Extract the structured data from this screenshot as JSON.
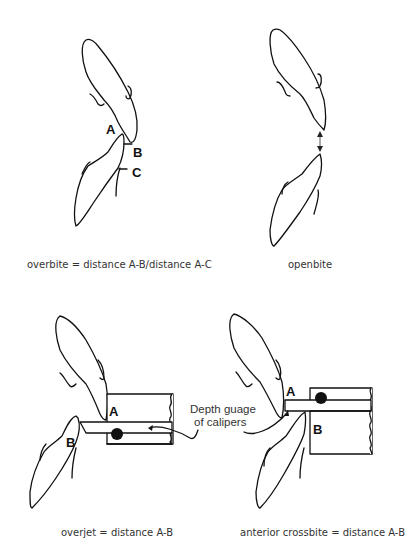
{
  "panels": [
    {
      "id": "overbite",
      "caption": "overbite = distance A-B/distance A-C",
      "labels": {
        "a": "A",
        "b": "B",
        "c": "C"
      }
    },
    {
      "id": "openbite",
      "caption": "openbite"
    },
    {
      "id": "overjet",
      "caption": "overjet = distance A-B",
      "labels": {
        "a": "A",
        "b": "B"
      }
    },
    {
      "id": "anterior-crossbite",
      "caption": "anterior crossbite = distance A-B",
      "labels": {
        "a": "A",
        "b": "B"
      }
    }
  ],
  "annotation": {
    "line1": "Depth guage",
    "line2": "of calipers"
  }
}
